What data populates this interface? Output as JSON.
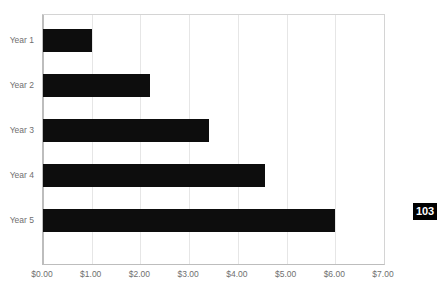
{
  "page": {
    "badge_number": "103"
  },
  "chart_data": {
    "type": "bar",
    "orientation": "horizontal",
    "title": "",
    "subtitle": "",
    "xlabel": "",
    "ylabel": "",
    "categories": [
      "Year 1",
      "Year 2",
      "Year 3",
      "Year 4",
      "Year 5"
    ],
    "values": [
      1.0,
      2.2,
      3.4,
      4.55,
      6.0
    ],
    "series": [
      {
        "name": "",
        "values": [
          1.0,
          2.2,
          3.4,
          4.55,
          6.0
        ],
        "color": "#0d0d0d"
      }
    ],
    "xlim": [
      0,
      7
    ],
    "ylim": null,
    "xticks": [
      0,
      1,
      2,
      3,
      4,
      5,
      6,
      7
    ],
    "xticklabels": [
      "$0.00",
      "$1.00",
      "$2.00",
      "$3.00",
      "$4.00",
      "$5.00",
      "$6.00",
      "$7.00"
    ],
    "yticklabels": [
      "Year 1",
      "Year 2",
      "Year 3",
      "Year 4",
      "Year 5"
    ],
    "grid": "vertical",
    "gridcolor": "#e6e6e6",
    "legend": null,
    "legend_position": "none",
    "annotations": [],
    "bar_color": "#0d0d0d",
    "plot_background": "#ffffff",
    "axis_color": "#bdbdbd",
    "tick_label_color": "#6f6f6f"
  }
}
